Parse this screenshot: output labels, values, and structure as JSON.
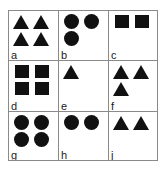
{
  "figure": {
    "type": "shape-grid-diagram",
    "rows": 3,
    "columns": 3,
    "background_color": "#ffffff",
    "line_color": "#8a8a8a",
    "shape_color": "#111111",
    "cells": [
      {
        "label": "a",
        "shape": "triangle",
        "count": 4,
        "arrangement": "2x2"
      },
      {
        "label": "b",
        "shape": "circle",
        "count": 3,
        "arrangement": "2-top-1-bottom-left"
      },
      {
        "label": "c",
        "shape": "square",
        "count": 2,
        "arrangement": "1-over-1-left"
      },
      {
        "label": "d",
        "shape": "square",
        "count": 4,
        "arrangement": "2x2"
      },
      {
        "label": "e",
        "shape": "triangle",
        "count": 1,
        "arrangement": "single-top-left"
      },
      {
        "label": "f",
        "shape": "triangle",
        "count": 3,
        "arrangement": "2-top-1-bottom-left"
      },
      {
        "label": "g",
        "shape": "circle",
        "count": 4,
        "arrangement": "2x2"
      },
      {
        "label": "h",
        "shape": "circle",
        "count": 2,
        "arrangement": "1-over-1-left"
      },
      {
        "label": "j",
        "shape": "triangle",
        "count": 2,
        "arrangement": "1-row-of-2"
      }
    ]
  }
}
